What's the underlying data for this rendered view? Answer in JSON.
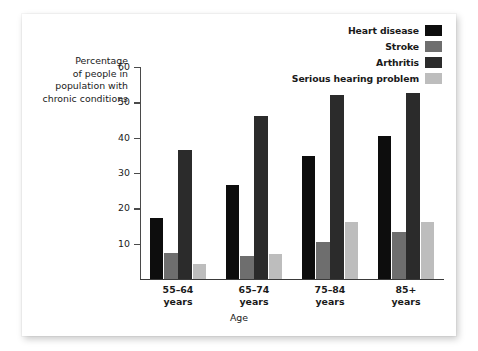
{
  "chart_data": {
    "type": "bar",
    "title": "",
    "xlabel": "Age",
    "ylabel": "Percentage of people in population with chronic conditions",
    "ylabel_lines": [
      "Percentage",
      "of people in",
      "population with",
      "chronic conditions"
    ],
    "categories": [
      "55–64 years",
      "65–74 years",
      "75–84 years",
      "85+ years"
    ],
    "category_lines": [
      [
        "55–64",
        "years"
      ],
      [
        "65–74",
        "years"
      ],
      [
        "75–84",
        "years"
      ],
      [
        "85+",
        "years"
      ]
    ],
    "series": [
      {
        "name": "Heart disease",
        "color": "#0d0d0d",
        "values": [
          17.3,
          26.6,
          34.8,
          40.5
        ]
      },
      {
        "name": "Stroke",
        "color": "#6e6e6e",
        "values": [
          7.3,
          6.5,
          10.5,
          13.4
        ]
      },
      {
        "name": "Arthritis",
        "color": "#2b2b2b",
        "values": [
          36.4,
          46.0,
          52.0,
          52.6
        ]
      },
      {
        "name": "Serious hearing problem",
        "color": "#bdbdbd",
        "values": [
          4.3,
          7.0,
          16.1,
          16.1
        ]
      }
    ],
    "ylim": [
      0,
      60
    ],
    "yticks": [
      10,
      20,
      30,
      40,
      50,
      60
    ],
    "ytick_labels": [
      "10",
      "20",
      "30",
      "40",
      "50",
      "60"
    ],
    "grid": false,
    "legend_position": "top-right",
    "legend_entries": [
      {
        "label": "Heart disease",
        "color": "#0d0d0d"
      },
      {
        "label": "Stroke",
        "color": "#6e6e6e"
      },
      {
        "label": "Arthritis",
        "color": "#2b2b2b"
      },
      {
        "label": "Serious hearing problem",
        "color": "#bdbdbd"
      }
    ]
  }
}
